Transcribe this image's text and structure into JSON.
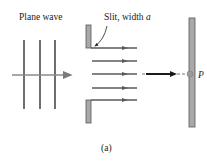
{
  "labels": {
    "plane_wave": "Plane wave",
    "slit_prefix": "Slit, width ",
    "slit_var": "a",
    "point": "P",
    "caption": "(a)"
  },
  "colors": {
    "wave": "#6e6e6e",
    "arrow": "#7a7a7a",
    "barrier_fill": "#a9a9a9",
    "barrier_stroke": "#555555",
    "ray": "#5a5a5a",
    "center_arrow": "#1a1a1a",
    "screen_fill": "#a9a9a9",
    "point": "#9a9a9a"
  },
  "diagram": {
    "wavefront_count": 3,
    "ray_count": 5
  }
}
